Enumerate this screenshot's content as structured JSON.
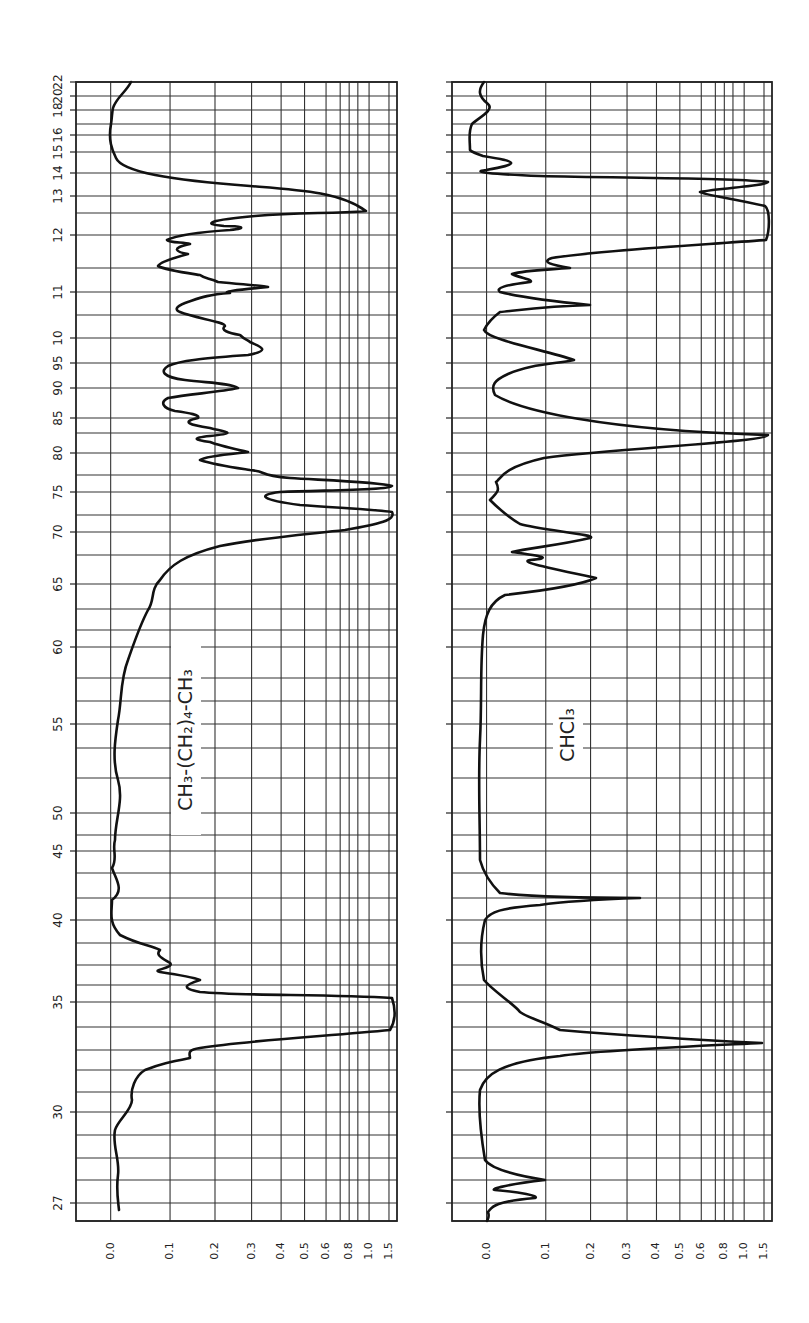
{
  "chart_data": [
    {
      "type": "line",
      "title": "CH3-(CH2)4-CH3",
      "label_display": "CH₃-(CH₂)₄-CH₃",
      "xlabel": "Wavelength (μ) — printed as 27=2.7, 30=3.0 … 95=9.5, 10…22",
      "ylabel": "Absorbance",
      "orientation": "rotated 90°: wavelength runs bottom→top, absorbance left→right",
      "wavelength_ticks": [
        "27",
        "30",
        "35",
        "40",
        "45",
        "50",
        "55",
        "60",
        "65",
        "70",
        "75",
        "80",
        "85",
        "90",
        "95",
        "10",
        "11",
        "12",
        "13",
        "14",
        "15",
        "16",
        "18",
        "20",
        "22"
      ],
      "absorbance_ticks": [
        "0.0",
        "0.1",
        "0.2",
        "0.3",
        "0.4",
        "0.5",
        "0.6",
        "0.8",
        "1.0",
        "1.5"
      ],
      "xlim_microns": [
        2.6,
        22
      ],
      "ylim_absorbance": [
        0.0,
        1.5
      ],
      "grid": true,
      "peaks": [
        {
          "wavelength": 3.4,
          "absorbance": 1.5,
          "note": "saturated C-H stretch"
        },
        {
          "wavelength": 3.6,
          "absorbance": 0.4
        },
        {
          "wavelength": 3.7,
          "absorbance": 0.25
        },
        {
          "wavelength": 6.8,
          "absorbance": 1.5,
          "note": "saturated"
        },
        {
          "wavelength": 7.05,
          "absorbance": 0.3
        },
        {
          "wavelength": 7.25,
          "absorbance": 1.5
        },
        {
          "wavelength": 7.4,
          "absorbance": 0.45
        },
        {
          "wavelength": 7.7,
          "absorbance": 0.3
        },
        {
          "wavelength": 8.7,
          "absorbance": 0.3
        },
        {
          "wavelength": 9.35,
          "absorbance": 0.3
        },
        {
          "wavelength": 11.1,
          "absorbance": 0.3
        },
        {
          "wavelength": 13.2,
          "absorbance": 0.3
        },
        {
          "wavelength": 13.8,
          "absorbance": 1.0
        }
      ],
      "baseline_absorbance": 0.05
    },
    {
      "type": "line",
      "title": "CHCl3",
      "label_display": "CHCl₃",
      "xlabel": "Wavelength (μ)",
      "ylabel": "Absorbance",
      "wavelength_ticks": [
        "27",
        "30",
        "35",
        "40",
        "45",
        "50",
        "55",
        "60",
        "65",
        "70",
        "75",
        "80",
        "85",
        "90",
        "95",
        "10",
        "11",
        "12",
        "13",
        "14",
        "15",
        "16",
        "18",
        "20",
        "22"
      ],
      "absorbance_ticks": [
        "0.0",
        "0.1",
        "0.2",
        "0.3",
        "0.4",
        "0.5",
        "0.6",
        "0.8",
        "1.0",
        "1.5"
      ],
      "xlim_microns": [
        2.6,
        22
      ],
      "ylim_absorbance": [
        0.0,
        1.5
      ],
      "grid": true,
      "peaks": [
        {
          "wavelength": 2.75,
          "absorbance": 0.08
        },
        {
          "wavelength": 2.85,
          "absorbance": 0.09
        },
        {
          "wavelength": 3.3,
          "absorbance": 1.4,
          "note": "C-H stretch"
        },
        {
          "wavelength": 3.35,
          "absorbance": 0.15
        },
        {
          "wavelength": 4.15,
          "absorbance": 0.3
        },
        {
          "wavelength": 6.6,
          "absorbance": 0.2
        },
        {
          "wavelength": 6.75,
          "absorbance": 0.1
        },
        {
          "wavelength": 7.0,
          "absorbance": 0.2
        },
        {
          "wavelength": 8.2,
          "absorbance": 1.5,
          "note": "saturated"
        },
        {
          "wavelength": 9.4,
          "absorbance": 0.15
        },
        {
          "wavelength": 10.8,
          "absorbance": 0.3
        },
        {
          "wavelength": 11.6,
          "absorbance": 0.18
        },
        {
          "wavelength": 12.8,
          "absorbance": 1.5,
          "note": "saturated C-Cl"
        },
        {
          "wavelength": 14.6,
          "absorbance": 0.5
        },
        {
          "wavelength": 15.1,
          "absorbance": 1.5
        },
        {
          "wavelength": 15.7,
          "absorbance": 0.12
        },
        {
          "wavelength": 16.0,
          "absorbance": 0.2
        }
      ],
      "baseline_absorbance": 0.02
    }
  ],
  "layout": {
    "top": 82,
    "bottom": 1221,
    "panels": [
      {
        "left": 76,
        "right": 397,
        "label_x": 192,
        "label_y": 740
      },
      {
        "left": 452,
        "right": 772,
        "label_x": 574,
        "label_y": 735
      }
    ],
    "wl_labels": [
      {
        "t": "22",
        "y": 82
      },
      {
        "t": "20",
        "y": 96
      },
      {
        "t": "18",
        "y": 110
      },
      {
        "t": "16",
        "y": 135
      },
      {
        "t": "15",
        "y": 152
      },
      {
        "t": "14",
        "y": 173
      },
      {
        "t": "13",
        "y": 196
      },
      {
        "t": "12",
        "y": 235
      },
      {
        "t": "11",
        "y": 292
      },
      {
        "t": "10",
        "y": 338
      },
      {
        "t": "95",
        "y": 363
      },
      {
        "t": "90",
        "y": 388
      },
      {
        "t": "85",
        "y": 418
      },
      {
        "t": "80",
        "y": 453
      },
      {
        "t": "75",
        "y": 492
      },
      {
        "t": "70",
        "y": 532
      },
      {
        "t": "65",
        "y": 584
      },
      {
        "t": "60",
        "y": 647
      },
      {
        "t": "55",
        "y": 724
      },
      {
        "t": "50",
        "y": 813
      },
      {
        "t": "45",
        "y": 851
      },
      {
        "t": "40",
        "y": 920
      },
      {
        "t": "35",
        "y": 1002
      },
      {
        "t": "30",
        "y": 1112
      },
      {
        "t": "27",
        "y": 1203
      }
    ],
    "hgrid": [
      82,
      96,
      110,
      124,
      135,
      152,
      173,
      196,
      213,
      235,
      268,
      292,
      315,
      338,
      363,
      388,
      418,
      433,
      453,
      475,
      492,
      515,
      532,
      555,
      584,
      609,
      630,
      647,
      678,
      701,
      724,
      748,
      778,
      813,
      835,
      851,
      873,
      898,
      920,
      943,
      965,
      985,
      1002,
      1027,
      1050,
      1070,
      1092,
      1112,
      1135,
      1158,
      1180,
      1203,
      1221
    ],
    "abs_labels": [
      {
        "t": "0.0",
        "f": 0.108
      },
      {
        "t": "0.1",
        "f": 0.293
      },
      {
        "t": "0.2",
        "f": 0.433
      },
      {
        "t": "0.3",
        "f": 0.547
      },
      {
        "t": "0.4",
        "f": 0.639
      },
      {
        "t": "0.5",
        "f": 0.712
      },
      {
        "t": "0.6",
        "f": 0.779
      },
      {
        "t": "0.8",
        "f": 0.851
      },
      {
        "t": "1.0",
        "f": 0.913
      },
      {
        "t": "1.5",
        "f": 0.975
      }
    ],
    "vgrid_frac": [
      0.108,
      0.293,
      0.433,
      0.547,
      0.639,
      0.712,
      0.779,
      0.823,
      0.851,
      0.878,
      0.913,
      0.975
    ]
  },
  "traces": {
    "p1": "M131,82 C126,92 116,98 113,108 C112,112 112,118 111,124 C108,140 112,150 116,158 C122,172 170,180 250,186 C300,190 340,192 366,211 C330,214 300,212 255,216 C210,220 200,224 224,226 C240,226 250,228 230,230 C200,232 175,236 167,240 C170,243 184,242 190,244 C170,248 176,252 188,254 C173,258 160,262 158,266 C165,270 180,272 200,275 C205,279 210,278 218,282 C250,285 265,286 268,287 C235,290 220,292 230,293 C205,295 200,298 185,303 C175,307 175,310 180,312 C195,318 225,322 225,326 C220,330 228,333 240,335 C245,340 248,340 250,342 C258,346 274,350 248,355 C210,358 180,360 168,366 C160,371 162,377 185,380 C210,383 230,383 238,388 C220,392 190,394 168,398 C160,402 162,408 175,411 C190,413 200,415 198,418 C180,422 190,425 210,428 C225,432 240,433 210,436 C190,438 195,440 210,442 C220,446 240,450 248,452 C230,454 205,456 200,460 C215,465 230,467 250,470 C270,472 255,475 290,478 C320,480 380,482 392,486 C390,490 330,490 280,492 C255,495 262,500 300,505 C340,508 380,510 392,512 C396,520 380,524 345,530 C300,535 260,538 220,546 C185,555 170,565 160,580 C150,590 155,600 148,610 C140,625 135,640 128,660 C120,680 122,700 118,720 C115,740 112,760 118,780 C124,800 115,820 115,840 C112,850 118,858 112,868 C116,880 125,890 112,900 C112,912 108,922 120,935 C140,945 150,945 160,950 C155,955 162,958 170,963 C175,968 150,970 160,972 C180,975 195,978 200,980 C185,985 180,988 200,992 C240,996 330,994 392,998 C396,1010 396,1020 390,1030 C330,1036 250,1040 200,1048 C186,1050 190,1054 190,1058 C170,1062 160,1064 145,1070 C135,1076 130,1090 132,1100 C132,1110 118,1120 115,1130 C112,1145 120,1160 118,1175 C116,1190 118,1200 119,1210",
    "p2": "M484,82 C478,90 478,96 488,104 C495,110 478,118 472,124 C468,132 470,140 470,150 C472,152 480,155 483,156 C520,162 520,164 486,170 C470,172 490,174 540,176 C620,178 740,178 768,182 C766,186 720,188 700,192 C705,195 730,198 765,206 C770,210 770,230 766,240 C700,245 600,250 552,258 C540,262 552,265 570,268 C545,270 525,270 512,274 C520,278 535,280 530,282 C505,285 495,288 500,292 C520,297 560,302 590,305 C550,306 520,310 500,312 C492,318 488,322 484,330 C488,340 545,350 574,360 C555,364 530,364 508,374 C495,380 490,385 495,395 C520,410 600,430 768,435 C768,442 620,448 544,458 C500,468 500,480 496,482 C500,490 498,492 490,500 C500,510 510,518 520,524 C540,530 600,535 590,538 C560,545 530,548 512,552 C540,556 555,558 530,560 C520,562 540,566 596,578 C580,585 550,590 505,595 C490,602 485,615 483,635 C480,670 482,700 480,740 C478,780 480,820 480,860 C484,875 492,885 500,893 C540,898 600,898 640,898 C580,900 560,902 540,905 C500,908 490,912 485,920 C480,940 480,960 484,980 C492,990 515,1005 520,1012 C528,1018 540,1020 560,1030 C620,1035 700,1040 762,1043 C700,1046 600,1050 560,1056 C500,1062 485,1075 480,1090 C478,1110 480,1130 485,1160 C492,1170 520,1176 545,1180 C500,1185 490,1190 495,1190 C520,1192 540,1196 535,1198 C490,1202 492,1208 488,1212 C490,1218 487,1220 487,1221"
  }
}
